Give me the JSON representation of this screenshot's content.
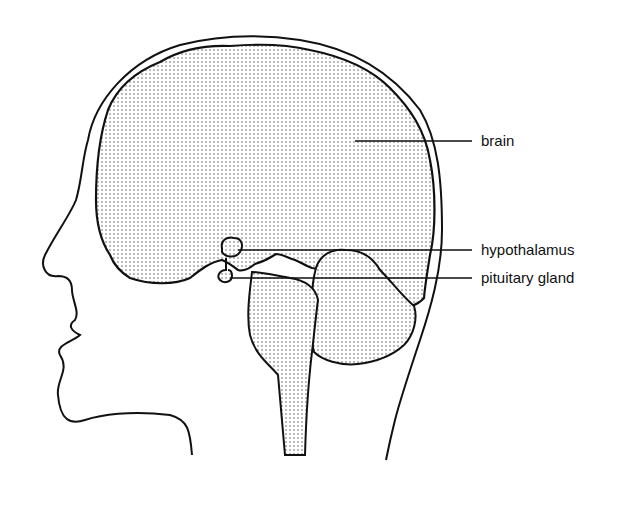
{
  "diagram": {
    "labels": [
      {
        "id": "brain",
        "text": "brain"
      },
      {
        "id": "hypothalamus",
        "text": "hypothalamus"
      },
      {
        "id": "pituitary",
        "text": "pituitary gland"
      }
    ],
    "colors": {
      "line": "#111111",
      "stipple": "#555555",
      "background": "#ffffff"
    }
  }
}
